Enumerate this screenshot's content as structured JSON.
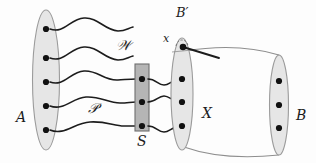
{
  "figure": {
    "background_color": "#fdfdfd",
    "ink_color": "#1c1c1c",
    "fill_gray": "#e3e3e3",
    "fill_gray_dark": "#b9b9b9"
  },
  "labels": {
    "A": "A",
    "S": "S",
    "X": "X",
    "B": "B",
    "B_prime": "B′",
    "x": "x",
    "W": "𝒲",
    "P": "𝒫"
  },
  "sets": {
    "A": {
      "label": "A",
      "shape": "ellipse",
      "cx": 46,
      "cy": 80,
      "rx": 13.5,
      "ry": 70,
      "point_count": 5,
      "points_y": [
        29,
        58,
        82,
        106,
        130
      ]
    },
    "S": {
      "label": "S",
      "shape": "rectangle",
      "x": 135,
      "y": 64,
      "width": 14,
      "height": 67,
      "point_count": 3,
      "points_y": [
        79,
        102,
        126
      ]
    },
    "X": {
      "label": "X",
      "shape": "ellipse",
      "cx": 182,
      "cy": 94,
      "rx": 11,
      "ry": 56,
      "point_count": 4,
      "points_y": [
        47,
        79,
        102,
        126
      ],
      "marked_point_label": "x",
      "subset_label": "B′"
    },
    "B": {
      "label": "B",
      "shape": "ellipse",
      "cx": 279,
      "cy": 105,
      "rx": 9.5,
      "ry": 50,
      "point_count": 3,
      "points_y": [
        81,
        105,
        128
      ]
    }
  },
  "families": {
    "W": {
      "label": "𝒲",
      "description": "upper family of wavy curves leaving A",
      "curve_count": 2
    },
    "P": {
      "label": "𝒫",
      "description": "lower family of wavy curves from A through S to X",
      "curve_count": 3
    }
  },
  "connectors": {
    "cylinder": {
      "description": "tube joining X to B",
      "top_y": 50,
      "bottom_y": 156
    },
    "pointer_line": {
      "description": "straight segment from marked point x toward the right",
      "from": [
        183,
        47
      ],
      "to": [
        219,
        58
      ]
    }
  }
}
